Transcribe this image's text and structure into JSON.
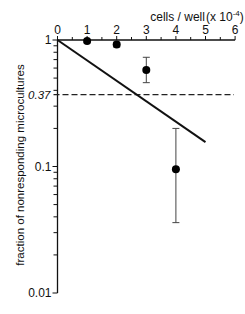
{
  "chart_data": {
    "type": "scatter",
    "title": "",
    "xlabel": "cells / well (x 10^-4)",
    "xlabel_main": "cells / well",
    "xlabel_suffix": "(x 10",
    "xlabel_exp": "-4",
    "xlabel_close": ")",
    "ylabel": "fraction of nonresponding microcultures",
    "xlim": [
      0,
      6
    ],
    "ylim": [
      0.01,
      1
    ],
    "yscale": "log",
    "x_ticks": [
      0,
      1,
      2,
      3,
      4,
      5,
      6
    ],
    "x_tick_labels": [
      "0",
      "1",
      "2",
      "3",
      "4",
      "5",
      "6"
    ],
    "y_ticks": [
      1,
      0.1,
      0.01
    ],
    "y_tick_labels": [
      "1",
      "0.1",
      "0.01"
    ],
    "x_axis_position": "top",
    "grid": false,
    "series": [
      {
        "name": "observed",
        "marker": "filled-circle",
        "x": [
          1,
          2,
          3,
          4
        ],
        "y": [
          0.98,
          0.92,
          0.58,
          0.095
        ],
        "y_err_low": [
          0.95,
          0.88,
          0.46,
          0.036
        ],
        "y_err_high": [
          1.0,
          0.96,
          0.73,
          0.2
        ]
      },
      {
        "name": "fit line",
        "type": "line",
        "x": [
          0,
          5
        ],
        "y": [
          1.0,
          0.156
        ]
      }
    ],
    "reference_line": {
      "type": "horizontal-dashed",
      "y": 0.37,
      "label": "0.37"
    }
  }
}
